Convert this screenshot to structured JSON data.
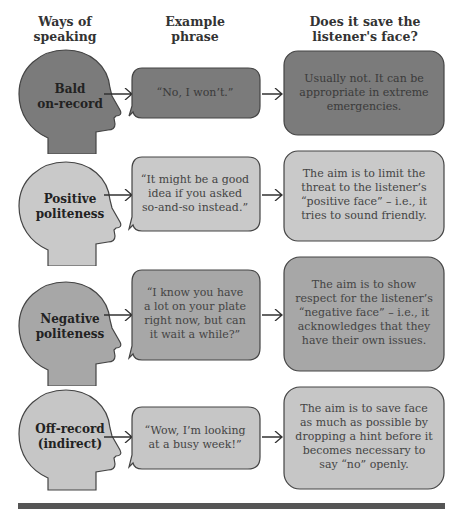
{
  "headers": {
    "col1": "Ways of speaking",
    "col1_lines": [
      "Ways of",
      "speaking"
    ],
    "col2_lines": [
      "Example",
      "phrase"
    ],
    "col3_lines": [
      "Does it save the",
      "listener's face?"
    ]
  },
  "rows": [
    {
      "way_lines": [
        "Bald",
        "on-record"
      ],
      "phrase_lines": [
        "“No, I won’t.”"
      ],
      "answer_lines": [
        "Usually not. It can be",
        "appropriate in extreme",
        "emergencies."
      ],
      "fill": "#7b7b7b"
    },
    {
      "way_lines": [
        "Positive",
        "politeness"
      ],
      "phrase_lines": [
        "“It might be a good",
        "idea if you asked",
        "so-and-so instead.”"
      ],
      "answer_lines": [
        "The aim is to limit the",
        "threat to the listener’s",
        "“positive face” – i.e., it",
        "tries to sound friendly."
      ],
      "fill": "#c9c9c9"
    },
    {
      "way_lines": [
        "Negative",
        "politeness"
      ],
      "phrase_lines": [
        "“I know you have",
        "a lot on your plate",
        "right now, but can",
        "it wait a while?”"
      ],
      "answer_lines": [
        "The aim is to show",
        "respect for the listener’s",
        "“negative face” – i.e., it",
        "acknowledges that they",
        "have their own issues."
      ],
      "fill": "#a7a7a7"
    },
    {
      "way_lines": [
        "Off-record",
        "(indirect)"
      ],
      "phrase_lines": [
        "“Wow, I’m looking",
        "at a busy week!”"
      ],
      "answer_lines": [
        "The aim is to save face",
        "as much as possible by",
        "dropping a hint before it",
        "becomes necessary to",
        "say “no” openly."
      ],
      "fill": "#c6c6c6"
    }
  ],
  "colors": {
    "footer_bar": "#555555",
    "outline": "#444444"
  }
}
